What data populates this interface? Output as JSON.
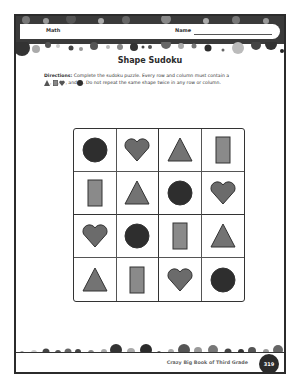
{
  "header": {
    "subject": "Math",
    "name_label": "Name"
  },
  "worksheet": {
    "title": "Shape Sudoku",
    "directions_label": "Directions:",
    "directions_text_1": "Complete the sudoku puzzle. Every row and column must contain a",
    "directions_text_2": ", and",
    "directions_text_3": ". Do not repeat the same shape twice in any row or column.",
    "shape_legend": [
      "triangle",
      "rectangle",
      "heart",
      "circle"
    ]
  },
  "puzzle": {
    "rows": [
      [
        "circle",
        "heart",
        "triangle",
        "rectangle"
      ],
      [
        "rectangle",
        "triangle",
        "circle",
        "heart"
      ],
      [
        "heart",
        "circle",
        "rectangle",
        "triangle"
      ],
      [
        "triangle",
        "rectangle",
        "heart",
        "circle"
      ]
    ],
    "colors": {
      "circle": "#2e2e2e",
      "heart": "#6b6b6b",
      "triangle": "#737373",
      "rectangle": "#8a8a8a"
    }
  },
  "footer": {
    "book_title": "Crazy Big Book of Third Grade",
    "page_number": "319"
  }
}
